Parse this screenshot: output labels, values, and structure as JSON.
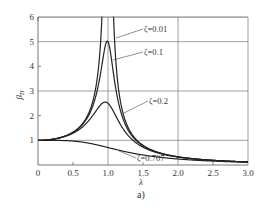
{
  "chart_data": {
    "type": "line",
    "title": "",
    "subtitle_label": "a)",
    "xlabel": "λ",
    "ylabel": "β_D",
    "xlim": [
      0,
      3.0
    ],
    "ylim": [
      0,
      6
    ],
    "xticks": [
      "0",
      "0.5",
      "1.0",
      "1.5",
      "2.0",
      "2.5",
      "3.0"
    ],
    "yticks": [
      "1",
      "2",
      "3",
      "4",
      "5",
      "6"
    ],
    "grid": {
      "horizontal": [
        1,
        3,
        5,
        6
      ],
      "vertical": [
        1.0,
        2.0,
        3.0
      ]
    },
    "formula": "β = 1/sqrt((1-λ²)² + (2ζλ)²)",
    "series": [
      {
        "name": "ζ=0.01",
        "zeta": 0.01,
        "peak": 50
      },
      {
        "name": "ζ=0.1",
        "zeta": 0.1,
        "peak": 5.0
      },
      {
        "name": "ζ=0.2",
        "zeta": 0.2,
        "peak": 2.5
      },
      {
        "name": "ζ=0.707",
        "zeta": 0.707,
        "peak": 1.0
      }
    ],
    "annotations": [
      {
        "text": "ζ=0.01",
        "at_series": 0
      },
      {
        "text": "ζ=0.1",
        "at_series": 1
      },
      {
        "text": "ζ=0.2",
        "at_series": 2
      },
      {
        "text": "ζ=0.707",
        "at_series": 3
      }
    ]
  }
}
